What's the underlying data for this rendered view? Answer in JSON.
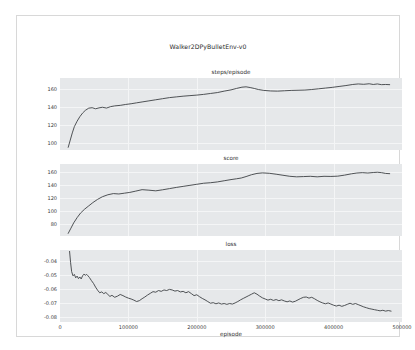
{
  "figure": {
    "title": "Walker2DPyBulletEnv-v0",
    "background": "#ffffff",
    "axes_facecolor": "#e6e8ea",
    "grid_color": "#f4f5f6",
    "line_color": "#3d4144",
    "border_color": "#d8d8d8"
  },
  "chart_data": [
    {
      "type": "line",
      "title": "steps/episode",
      "xlabel": "",
      "ylabel": "",
      "xlim": [
        0,
        500000
      ],
      "ylim": [
        92,
        172
      ],
      "yticks": [
        100,
        120,
        140,
        160
      ],
      "ytick_labels": [
        "100",
        "120",
        "140",
        "160"
      ],
      "xticks": [
        0,
        100000,
        200000,
        300000,
        400000,
        500000
      ],
      "xtick_labels": [
        "",
        "",
        "",
        "",
        "",
        ""
      ],
      "grid": true,
      "legend": "none",
      "series": [
        {
          "name": "steps/episode",
          "x": [
            12000,
            15000,
            18000,
            21000,
            25000,
            29000,
            33000,
            37000,
            42000,
            47000,
            52000,
            57000,
            62000,
            68000,
            74000,
            80000,
            88000,
            96000,
            104000,
            112000,
            120000,
            130000,
            140000,
            150000,
            160000,
            170000,
            180000,
            190000,
            200000,
            210000,
            220000,
            230000,
            240000,
            250000,
            258000,
            266000,
            272000,
            278000,
            284000,
            290000,
            298000,
            308000,
            318000,
            328000,
            338000,
            348000,
            358000,
            368000,
            378000,
            388000,
            398000,
            408000,
            418000,
            428000,
            436000,
            444000,
            452000,
            458000,
            464000,
            470000,
            476000,
            482000
          ],
          "y": [
            95.0,
            103.0,
            111.0,
            118.0,
            124.0,
            129.0,
            133.0,
            136.0,
            138.5,
            139.0,
            137.8,
            138.8,
            139.5,
            138.6,
            140.2,
            141.0,
            141.6,
            142.6,
            143.4,
            144.4,
            145.4,
            146.6,
            147.8,
            149.0,
            150.2,
            151.0,
            151.8,
            152.4,
            153.0,
            153.8,
            154.8,
            155.8,
            157.4,
            158.8,
            160.4,
            161.8,
            162.2,
            161.4,
            160.4,
            159.2,
            158.2,
            157.6,
            157.4,
            157.8,
            158.2,
            158.4,
            158.6,
            159.2,
            160.0,
            160.8,
            161.6,
            162.6,
            163.6,
            164.8,
            165.4,
            165.0,
            165.6,
            164.8,
            165.4,
            164.6,
            164.8,
            164.6
          ]
        }
      ]
    },
    {
      "type": "line",
      "title": "score",
      "xlabel": "",
      "ylabel": "",
      "xlim": [
        0,
        500000
      ],
      "ylim": [
        62,
        172
      ],
      "yticks": [
        80,
        100,
        120,
        140,
        160
      ],
      "ytick_labels": [
        "80",
        "100",
        "120",
        "140",
        "160"
      ],
      "xticks": [
        0,
        100000,
        200000,
        300000,
        400000,
        500000
      ],
      "xtick_labels": [
        "",
        "",
        "",
        "",
        "",
        ""
      ],
      "grid": true,
      "legend": "none",
      "series": [
        {
          "name": "score",
          "x": [
            12000,
            16000,
            20000,
            25000,
            30000,
            36000,
            42000,
            48000,
            55000,
            62000,
            70000,
            78000,
            86000,
            94000,
            102000,
            110000,
            120000,
            130000,
            140000,
            150000,
            160000,
            170000,
            180000,
            190000,
            200000,
            210000,
            220000,
            230000,
            240000,
            250000,
            258000,
            265000,
            272000,
            280000,
            288000,
            296000,
            306000,
            316000,
            326000,
            336000,
            346000,
            356000,
            366000,
            376000,
            386000,
            396000,
            406000,
            416000,
            426000,
            434000,
            442000,
            450000,
            458000,
            464000,
            470000,
            476000,
            482000
          ],
          "y": [
            66.0,
            74.0,
            82.0,
            90.0,
            97.0,
            103.0,
            108.0,
            113.0,
            118.0,
            122.0,
            125.0,
            126.8,
            126.2,
            127.4,
            128.6,
            130.4,
            132.8,
            132.0,
            131.0,
            132.6,
            134.4,
            136.2,
            137.8,
            139.4,
            141.0,
            142.6,
            143.4,
            144.6,
            146.4,
            148.2,
            149.4,
            150.6,
            152.8,
            155.6,
            157.6,
            158.4,
            157.8,
            156.4,
            154.8,
            153.2,
            152.4,
            152.8,
            153.2,
            152.4,
            153.2,
            153.0,
            153.4,
            155.0,
            157.0,
            158.2,
            158.8,
            158.2,
            159.0,
            159.4,
            158.8,
            157.6,
            157.2
          ]
        }
      ]
    },
    {
      "type": "line",
      "title": "loss",
      "xlabel": "episode",
      "ylabel": "",
      "xlim": [
        0,
        500000
      ],
      "ylim": [
        -0.0835,
        -0.0325
      ],
      "yticks": [
        -0.04,
        -0.05,
        -0.06,
        -0.07,
        -0.08
      ],
      "ytick_labels": [
        "-0.04",
        "-0.05",
        "-0.06",
        "-0.07",
        "-0.08"
      ],
      "xticks": [
        0,
        100000,
        200000,
        300000,
        400000,
        500000
      ],
      "xtick_labels": [
        "0",
        "100000",
        "200000",
        "300000",
        "400000",
        "500000"
      ],
      "grid": true,
      "legend": "none",
      "series": [
        {
          "name": "loss",
          "x": [
            14000,
            15500,
            17000,
            19000,
            21000,
            23000,
            25000,
            27000,
            29000,
            31000,
            33000,
            35000,
            37000,
            39000,
            41000,
            43000,
            46000,
            49000,
            52000,
            55000,
            58000,
            61000,
            64000,
            67000,
            70000,
            73000,
            76000,
            80000,
            84000,
            88000,
            92000,
            96000,
            100000,
            104000,
            108000,
            112000,
            116000,
            120000,
            124000,
            128000,
            132000,
            136000,
            140000,
            144000,
            148000,
            152000,
            156000,
            160000,
            164000,
            168000,
            172000,
            176000,
            180000,
            184000,
            188000,
            192000,
            196000,
            200000,
            204000,
            208000,
            212000,
            216000,
            220000,
            224000,
            228000,
            232000,
            236000,
            240000,
            244000,
            248000,
            252000,
            256000,
            260000,
            264000,
            268000,
            272000,
            276000,
            280000,
            284000,
            288000,
            292000,
            296000,
            300000,
            304000,
            308000,
            312000,
            316000,
            320000,
            324000,
            328000,
            332000,
            336000,
            340000,
            344000,
            348000,
            352000,
            356000,
            360000,
            364000,
            368000,
            372000,
            376000,
            380000,
            384000,
            388000,
            392000,
            396000,
            400000,
            404000,
            408000,
            412000,
            416000,
            420000,
            424000,
            428000,
            432000,
            436000,
            440000,
            444000,
            448000,
            452000,
            456000,
            460000,
            464000,
            468000,
            472000,
            476000,
            480000,
            484000
          ],
          "y": [
            -0.0335,
            -0.0415,
            -0.0478,
            -0.0508,
            -0.0498,
            -0.0522,
            -0.051,
            -0.0528,
            -0.0516,
            -0.053,
            -0.0508,
            -0.0496,
            -0.0504,
            -0.0498,
            -0.0508,
            -0.052,
            -0.0542,
            -0.0562,
            -0.0588,
            -0.061,
            -0.0628,
            -0.0622,
            -0.0634,
            -0.0626,
            -0.064,
            -0.0654,
            -0.0646,
            -0.066,
            -0.0652,
            -0.064,
            -0.0648,
            -0.0658,
            -0.0666,
            -0.0672,
            -0.068,
            -0.069,
            -0.0684,
            -0.067,
            -0.0658,
            -0.0644,
            -0.0632,
            -0.062,
            -0.0624,
            -0.0612,
            -0.0618,
            -0.0608,
            -0.0612,
            -0.0604,
            -0.0608,
            -0.0616,
            -0.0612,
            -0.0622,
            -0.0618,
            -0.0628,
            -0.062,
            -0.0634,
            -0.0648,
            -0.0642,
            -0.0656,
            -0.0668,
            -0.0678,
            -0.069,
            -0.0702,
            -0.0698,
            -0.0706,
            -0.07,
            -0.0708,
            -0.0704,
            -0.071,
            -0.0704,
            -0.0708,
            -0.07,
            -0.069,
            -0.0678,
            -0.0668,
            -0.0658,
            -0.0648,
            -0.0638,
            -0.0628,
            -0.0638,
            -0.0652,
            -0.0664,
            -0.0672,
            -0.068,
            -0.0674,
            -0.0682,
            -0.0676,
            -0.0684,
            -0.0678,
            -0.0686,
            -0.0692,
            -0.0686,
            -0.0694,
            -0.0688,
            -0.0678,
            -0.0668,
            -0.066,
            -0.0658,
            -0.0666,
            -0.066,
            -0.067,
            -0.0682,
            -0.0692,
            -0.07,
            -0.0706,
            -0.07,
            -0.0708,
            -0.0716,
            -0.0722,
            -0.0716,
            -0.0724,
            -0.0718,
            -0.071,
            -0.0702,
            -0.071,
            -0.0704,
            -0.0712,
            -0.072,
            -0.0728,
            -0.0734,
            -0.074,
            -0.0744,
            -0.0748,
            -0.0752,
            -0.0756,
            -0.0752,
            -0.0758,
            -0.0754,
            -0.0758
          ]
        }
      ]
    }
  ]
}
